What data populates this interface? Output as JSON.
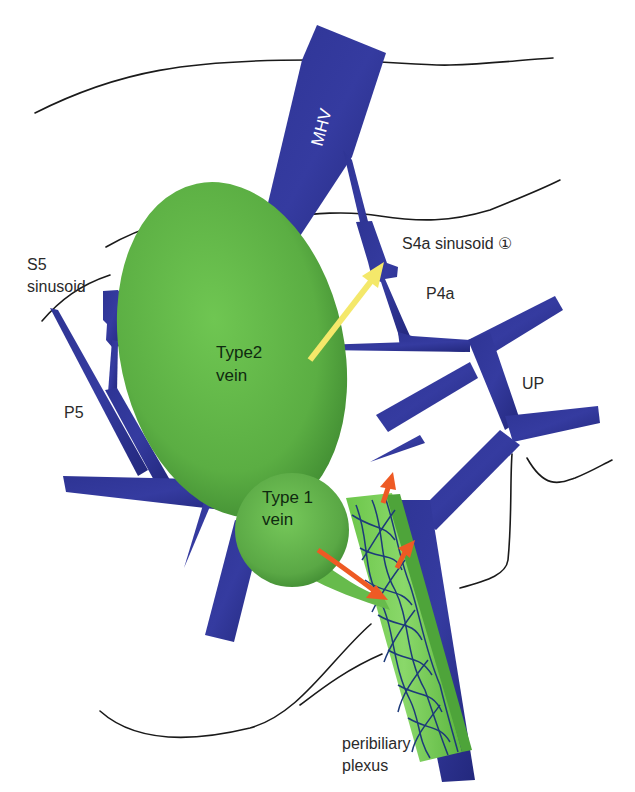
{
  "diagram": {
    "colors": {
      "vein_blue": "#2a2f8f",
      "vein_blue_dark": "#1f237a",
      "green_vein": "#5cad44",
      "green_light": "#7fd05e",
      "yellow_arrow": "#f4e86a",
      "orange_arrow": "#ee5a24",
      "outline": "#1a1a1a"
    },
    "labels": {
      "mhv": "MHV",
      "s4a_sinusoid": "S4a sinusoid ①",
      "p4a": "P4a",
      "s5_sinusoid_line1": "S5",
      "s5_sinusoid_line2": "sinusoid",
      "p5": "P5",
      "up": "UP",
      "type2_line1": "Type2",
      "type2_line2": "vein",
      "type1_line1": "Type 1",
      "type1_line2": "vein",
      "peribiliary_line1": "peribiliary",
      "peribiliary_line2": "plexus"
    },
    "structures": [
      {
        "id": "mhv",
        "name": "Middle hepatic vein",
        "type": "vessel"
      },
      {
        "id": "p4a",
        "name": "Portal branch P4a",
        "type": "vessel"
      },
      {
        "id": "p5",
        "name": "Portal branch P5",
        "type": "vessel"
      },
      {
        "id": "up",
        "name": "Umbilical portion",
        "type": "vessel"
      },
      {
        "id": "type2-vein",
        "name": "Type2 vein",
        "type": "ellipse"
      },
      {
        "id": "type1-vein",
        "name": "Type 1 vein",
        "type": "circle"
      },
      {
        "id": "peribiliary-plexus",
        "name": "Peribiliary plexus",
        "type": "mesh"
      }
    ],
    "arrows": [
      {
        "id": "type2-to-s4a",
        "color": "yellow",
        "from": "Type2 vein",
        "to": "S4a sinusoid"
      },
      {
        "id": "type1-to-plexus",
        "color": "orange",
        "from": "Type 1 vein",
        "to": "peribiliary plexus"
      },
      {
        "id": "plexus-outflow-1",
        "color": "orange",
        "direction": "up"
      },
      {
        "id": "plexus-outflow-2",
        "color": "orange",
        "direction": "up"
      }
    ]
  }
}
